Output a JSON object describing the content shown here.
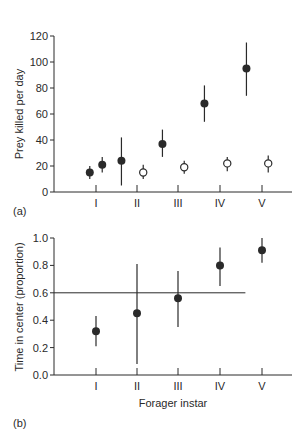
{
  "chart_data": [
    {
      "type": "scatter",
      "panel_label": "(a)",
      "title": "",
      "xlabel": "",
      "ylabel": "Prey killed per day",
      "ylim": [
        0,
        120
      ],
      "yticks": [
        0,
        20,
        40,
        60,
        80,
        100,
        120
      ],
      "categories": [
        "I",
        "II",
        "III",
        "IV",
        "V"
      ],
      "grid": false,
      "series": [
        {
          "name": "filled",
          "marker": "filled-circle",
          "points": [
            {
              "category": "I",
              "offset": -0.3,
              "y": 15,
              "lo": 10,
              "hi": 20
            },
            {
              "category": "I",
              "offset": 0.3,
              "y": 21,
              "lo": 15,
              "hi": 27
            },
            {
              "category": "II",
              "offset": -0.75,
              "y": 24,
              "lo": 5,
              "hi": 42
            },
            {
              "category": "III",
              "offset": -0.75,
              "y": 37,
              "lo": 27,
              "hi": 48
            },
            {
              "category": "IV",
              "offset": -0.75,
              "y": 68,
              "lo": 54,
              "hi": 82
            },
            {
              "category": "V",
              "offset": -0.75,
              "y": 95,
              "lo": 74,
              "hi": 115
            }
          ]
        },
        {
          "name": "open",
          "marker": "open-circle",
          "points": [
            {
              "category": "II",
              "offset": 0.3,
              "y": 15,
              "lo": 10,
              "hi": 21
            },
            {
              "category": "III",
              "offset": 0.3,
              "y": 19,
              "lo": 14,
              "hi": 24
            },
            {
              "category": "IV",
              "offset": 0.35,
              "y": 22,
              "lo": 16,
              "hi": 27
            },
            {
              "category": "V",
              "offset": 0.3,
              "y": 22,
              "lo": 15,
              "hi": 28
            }
          ]
        }
      ]
    },
    {
      "type": "scatter",
      "panel_label": "(b)",
      "title": "",
      "xlabel": "Forager instar",
      "ylabel": "Time in center (proportion)",
      "ylim": [
        0,
        1.0
      ],
      "yticks": [
        "0.0",
        "0.2",
        "0.4",
        "0.6",
        "0.8",
        "1.0"
      ],
      "categories": [
        "I",
        "II",
        "III",
        "IV",
        "V"
      ],
      "grid": false,
      "reference_line": {
        "y": 0.6,
        "x_end_category": "V",
        "x_end_offset": -0.4
      },
      "series": [
        {
          "name": "filled",
          "marker": "filled-circle",
          "points": [
            {
              "category": "I",
              "y": 0.32,
              "lo": 0.21,
              "hi": 0.43
            },
            {
              "category": "II",
              "y": 0.45,
              "lo": 0.08,
              "hi": 0.81
            },
            {
              "category": "III",
              "y": 0.56,
              "lo": 0.35,
              "hi": 0.76
            },
            {
              "category": "IV",
              "y": 0.8,
              "lo": 0.65,
              "hi": 0.93
            },
            {
              "category": "V",
              "y": 0.91,
              "lo": 0.82,
              "hi": 1.0
            }
          ]
        }
      ]
    }
  ],
  "panel_a": {
    "label": "(a)",
    "ylabel": "Prey killed per day",
    "yticks": [
      "0",
      "20",
      "40",
      "60",
      "80",
      "100",
      "120"
    ],
    "xticks": [
      "I",
      "II",
      "III",
      "IV",
      "V"
    ]
  },
  "panel_b": {
    "label": "(b)",
    "ylabel": "Time in center (proportion)",
    "xlabel": "Forager instar",
    "yticks": [
      "0.0",
      "0.2",
      "0.4",
      "0.6",
      "0.8",
      "1.0"
    ],
    "xticks": [
      "I",
      "II",
      "III",
      "IV",
      "V"
    ]
  },
  "colors": {
    "ink": "#2a2a2a",
    "background": "#ffffff"
  }
}
